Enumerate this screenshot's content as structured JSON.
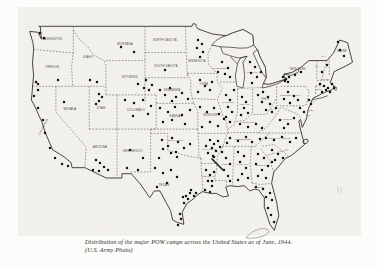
{
  "figure": {
    "caption_line1": "Distribution of the major POW camps across the United States as of June, 1944.",
    "caption_line2": "(U.S. Army Photo)"
  },
  "map": {
    "ink": "#35332c",
    "paper": "#f4f2ec",
    "outline": "M 39.2,26.3 L 192,26.3 L 193,23.6 L 195.8,24.2 L 196.2,26.6 L 198,28.9 L 212.3,34 L 226.3,35.7 L 232.4,33 L 243,29.5 L 252.6,35 L 253.7,45 L 257.5,49.8 L 260,57 L 265.4,67.4 L 266.1,77.7 L 263.2,83.7 L 269,84.5 L 277,82 L 285.5,79.4 L 283.8,74.3 L 292,72.5 L 299.5,68.3 L 309,60.6 L 326.9,60.6 L 333.6,52.9 L 339.7,40 L 347.5,42.6 L 352.5,62.3 L 346.4,65.7 L 334.1,71.7 L 330.2,82.9 L 335.2,87.2 L 331.5,90 L 324.7,92.3 L 312.9,98.3 L 308.5,108.6 L 307.3,113.7 L 306.7,118 L 302.3,127.4 L 300.6,119.5 L 298.8,121 L 300.6,130 L 304.5,144.6 L 291.1,155.7 L 285.5,158.3 L 279.9,165.1 L 273.8,172 L 271.6,183.1 L 276.6,202 L 278.8,215.7 L 274.3,230.3 L 269.9,224.3 L 264.3,207.1 L 264.3,197.7 L 258.7,190 L 254.8,189.1 L 249.8,190.9 L 244.2,185.7 L 237.5,186.6 L 229.7,185.7 L 225.8,187.4 L 228.5,196 L 223,196.9 L 216.3,193.4 L 210.7,193.4 L 202.3,191.7 L 197.3,195.1 L 193.9,198.6 L 186.7,203.7 L 182.2,212.3 L 183.9,224.3 L 177.7,222.6 L 172.7,220 L 170.5,210.6 L 159.9,190.9 L 154.3,190.9 L 149.8,197.7 L 140.3,184 L 131.3,173.7 L 121.9,173.7 L 121.9,178 L 106.2,178 L 85,167.7 L 72.1,167.7 L 71,162.6 L 64.9,157.4 L 52.6,149.7 L 45.3,132.6 L 42,122.3 L 34.7,106 L 31.4,100 L 33.6,75.1 L 32.5,63.1 L 33.6,49.4 L 33.1,43.4 L 29.7,31.4 L 38.1,32.3 L 41.4,39.1 L 40.3,27.1 Z",
    "lakes": [
      "M 211.8,45.1 L 216,40.5 L 222,37 L 226.3,35.7 L 232.4,33 L 243,29.5 L 252.6,35 L 253.7,45 L 247.5,47.8 L 240,48.2 L 230,47.2 L 220.5,46.8 Z",
      "M 247,56.3 L 243,62.3 L 244.7,75.2 L 243,88 L 236.9,86.3 L 235.3,76 L 237.5,64 L 240.3,58 Z",
      "M 257.5,49.8 L 260,57 L 265.4,67.4 L 266.1,77.7 L 262.5,73.5 L 258.5,65 L 255.2,57.5 L 253.1,52.9 Z",
      "M 262.3,88 L 270,86.3 L 278,83.6 L 285.5,79.4 L 277,82 L 269,84.5 L 263.2,83.7 Z",
      "M 283.8,74.3 L 291,75.3 L 298,72.5 L 299.5,68.3 L 292,72.5 Z"
    ],
    "shorelines": [
      "220.5,46.8 223,53.5 229.5,55.5 237,57.8 240.3,58",
      "240.3,58 244,57 247,56.3",
      "237.5,64 234,60.5 230.5,56.5",
      "313.5,99.5 321,98 327.5,95.8",
      "333.5,86.5 336.5,87.5 335.8,90.5"
    ],
    "borders": [
      "33.6,49.4 61.5,52 73.3,52.9",
      "73.3,26.3 73.3,52.9 71.6,66.6 72.7,86.3",
      "32.5,86.3 105.9,86.3",
      "73.3,30 80,40 87.8,46.9 93.9,55.4 104,60.6 105.9,64.9 105.9,94.9",
      "105.9,60.6 145,60.6",
      "145,26.3 145,103.4",
      "145,52.5 186.2,52.5",
      "185.5,26.3 186.2,52.5 187.5,77.7",
      "187.5,73.4 216.8,73.4",
      "187.5,73.4 191.1,82 190.6,90.6 193.9,103.4",
      "145,77.7 187.5,77.7",
      "156.2,103.4 193.9,103.4",
      "150.6,129.1 197.8,129.1",
      "156.2,94.9 156.2,129.1",
      "105.9,94.9 156.2,94.9",
      "89.2,86.3 89.2,129.1",
      "117.1,94.9 117.1,129.1",
      "89.2,129.1 156.2,129.1",
      "55.9,86.3 55.9,112 86.1,147.1 85,167.7",
      "117.1,129.1 117.1,178",
      "150.6,129.1 150.6,172",
      "130.8,172 150.6,172",
      "150.6,133.4 167.7,133.4 167.7,150.6 172.1,151.4 183.3,154.9 190,156.6 200.9,158.3",
      "193.9,103.4 197.8,111.1 197.8,129.1",
      "197.8,129.1 198.7,142 198.7,156.6 200.9,158.3",
      "200.9,158.3 201.5,172 202.9,189.1 202.3,191.7",
      "197.8,133.4 227.4,133.4",
      "200.9,163.4 216.8,163.4",
      "211.8,45.1 207.9,53.7",
      "207.9,53.7 208.4,64 216.8,73.4 217.4,82 222.4,88 217.4,99.1 221.9,112.9 226.3,123.1 228,132.6 225.2,138.6 223,146.3 217.4,156.6 216.8,166.9 214.6,180.6 227,180.6 226,187.4",
      "191.3,98.3 215.7,99.5",
      "220.1,82 236.9,82",
      "237.5,88.9 237.5,112 235.3,121.4",
      "276,99.1 267.1,113.7 259.8,114.6 251.4,114.6 244.2,120.6 235.3,121.4 234.2,124.9 228,129.1",
      "252.6,88.9 252.6,114.6",
      "237.5,88.5 262,87.5",
      "276.6,86.3 276.6,105.8",
      "276.6,105.8 302.9,105.8",
      "258.7,132.6 267,127 276,115 281,107",
      "258.7,133 302.3,133",
      "227.4,132.6 258.7,132.6",
      "221.9,146.3 255.4,146.3",
      "255.4,146.3 269.9,132.6",
      "262.1,146.3 274.3,144.6 287.7,155.7",
      "261,148.9 268.8,159.1 273.8,172",
      "234.2,146.3 232.4,185.7",
      "251.4,146.3 250.3,164 252,183.1",
      "252,183.1 260,184.5 271.6,183.5",
      "280.7,86.3 305.6,86.3",
      "305.6,86.3 309,91.4 306.8,104.3 302.9,105.8",
      "316.8,60.6 316.8,80.3",
      "321.3,80.3 326.9,60.6",
      "316.8,80.3 330,80.3",
      "315.7,85.9 324.7,85.9",
      "315.7,85.9 315.7,94",
      "329.5,75 329,58",
      "282,107.5 290,111 296,113.5 301,117.5"
    ],
    "state_labels": [
      {
        "t": "WASHINGTON",
        "x": 52,
        "y": 40,
        "s": 2.6
      },
      {
        "t": "OREGON",
        "x": 52,
        "y": 68,
        "s": 2.8
      },
      {
        "t": "IDAHO",
        "x": 88,
        "y": 58,
        "s": 2.8
      },
      {
        "t": "MONTANA",
        "x": 125,
        "y": 45,
        "s": 2.8
      },
      {
        "t": "NORTH DAKOTA",
        "x": 165,
        "y": 41,
        "s": 2.6
      },
      {
        "t": "SOUTH DAKOTA",
        "x": 166,
        "y": 67,
        "s": 2.6
      },
      {
        "t": "MINNESOTA",
        "x": 197,
        "y": 62,
        "s": 2.6
      },
      {
        "t": "WISCONSIN",
        "x": 221,
        "y": 69,
        "s": 2.5
      },
      {
        "t": "MICHIGAN",
        "x": 254,
        "y": 73,
        "s": 2.4
      },
      {
        "t": "NEW YORK",
        "x": 298,
        "y": 70,
        "s": 2.6
      },
      {
        "t": "MAINE",
        "x": 342,
        "y": 52,
        "s": 2.6
      },
      {
        "t": "PENNSYLVANIA",
        "x": 291,
        "y": 96,
        "s": 2.4
      },
      {
        "t": "OHIO",
        "x": 265,
        "y": 100,
        "s": 2.8
      },
      {
        "t": "INDIANA",
        "x": 245,
        "y": 105,
        "s": 2.3
      },
      {
        "t": "ILLINOIS",
        "x": 228,
        "y": 103,
        "s": 2.3
      },
      {
        "t": "IOWA",
        "x": 204,
        "y": 85,
        "s": 2.8
      },
      {
        "t": "NEBRASKA",
        "x": 172,
        "y": 91,
        "s": 2.6
      },
      {
        "t": "WYOMING",
        "x": 130,
        "y": 78,
        "s": 2.8
      },
      {
        "t": "UTAH",
        "x": 101,
        "y": 109,
        "s": 2.8
      },
      {
        "t": "NEVADA",
        "x": 70,
        "y": 110,
        "s": 2.8
      },
      {
        "t": "CALIFORNIA",
        "x": 44,
        "y": 127,
        "s": 2.6,
        "r": -62
      },
      {
        "t": "COLORADO",
        "x": 136,
        "y": 111,
        "s": 2.8
      },
      {
        "t": "KANSAS",
        "x": 176,
        "y": 117,
        "s": 2.8
      },
      {
        "t": "MISSOURI",
        "x": 211,
        "y": 116,
        "s": 2.6
      },
      {
        "t": "KENTUCKY",
        "x": 249,
        "y": 123,
        "s": 2.4
      },
      {
        "t": "W.VA",
        "x": 273,
        "y": 110,
        "s": 2.2
      },
      {
        "t": "VIRGINIA",
        "x": 288,
        "y": 120,
        "s": 2.4
      },
      {
        "t": "ARIZONA",
        "x": 100,
        "y": 148,
        "s": 2.8
      },
      {
        "t": "NEW MEXICO",
        "x": 133,
        "y": 152,
        "s": 2.6
      },
      {
        "t": "OKLAHOMA",
        "x": 176,
        "y": 141,
        "s": 2.5
      },
      {
        "t": "ARKANSAS",
        "x": 209,
        "y": 150,
        "s": 2.3
      },
      {
        "t": "TENNESSEE",
        "x": 243,
        "y": 140,
        "s": 2.4
      },
      {
        "t": "NORTH CAROLINA",
        "x": 280,
        "y": 139,
        "s": 2.2
      },
      {
        "t": "SOUTH CAROLINA",
        "x": 278,
        "y": 153,
        "s": 2.1,
        "r": -15
      },
      {
        "t": "GEORGIA",
        "x": 262,
        "y": 166,
        "s": 2.5
      },
      {
        "t": "ALABAMA",
        "x": 242,
        "y": 165,
        "s": 2.4
      },
      {
        "t": "MISS.",
        "x": 225,
        "y": 165,
        "s": 2.4
      },
      {
        "t": "LOUISIANA",
        "x": 209,
        "y": 177,
        "s": 2.3
      },
      {
        "t": "TEXAS",
        "x": 164,
        "y": 186,
        "s": 2.9
      },
      {
        "t": "FLORIDA",
        "x": 260,
        "y": 188,
        "s": 2.2
      },
      {
        "t": "VT.",
        "x": 317,
        "y": 67,
        "s": 2
      },
      {
        "t": "N.H.",
        "x": 324,
        "y": 57,
        "s": 2
      },
      {
        "t": "MASS.",
        "x": 326,
        "y": 79.5,
        "s": 2
      },
      {
        "t": "CONN.",
        "x": 319,
        "y": 89.5,
        "s": 2
      },
      {
        "t": "R.I.",
        "x": 336,
        "y": 90,
        "s": 2
      },
      {
        "t": "N.J.",
        "x": 313,
        "y": 102,
        "s": 2
      },
      {
        "t": "DEL.",
        "x": 312,
        "y": 110.5,
        "s": 2
      },
      {
        "t": "MD.",
        "x": 309,
        "y": 115.5,
        "s": 2
      }
    ],
    "camps": [
      [
        40,
        33
      ],
      [
        44,
        38
      ],
      [
        58,
        80
      ],
      [
        38,
        84
      ],
      [
        90,
        80
      ],
      [
        97,
        82
      ],
      [
        121,
        47
      ],
      [
        134,
        52
      ],
      [
        138,
        84
      ],
      [
        144,
        88
      ],
      [
        149,
        90
      ],
      [
        152,
        85
      ],
      [
        146,
        80
      ],
      [
        64,
        102
      ],
      [
        99,
        94
      ],
      [
        102,
        97
      ],
      [
        99,
        101
      ],
      [
        96,
        104
      ],
      [
        36,
        82
      ],
      [
        34,
        96
      ],
      [
        38,
        90
      ],
      [
        38,
        108
      ],
      [
        43,
        120
      ],
      [
        45,
        133
      ],
      [
        50,
        148
      ],
      [
        55,
        158
      ],
      [
        62,
        164
      ],
      [
        68,
        166
      ],
      [
        96,
        160
      ],
      [
        100,
        163
      ],
      [
        104,
        167
      ],
      [
        108,
        170
      ],
      [
        99,
        171
      ],
      [
        93,
        170
      ],
      [
        130,
        150
      ],
      [
        127,
        168
      ],
      [
        138,
        170
      ],
      [
        143,
        158
      ],
      [
        125,
        100
      ],
      [
        134,
        103
      ],
      [
        143,
        100
      ],
      [
        151,
        106
      ],
      [
        148,
        114
      ],
      [
        133,
        116
      ],
      [
        165,
        70
      ],
      [
        198,
        40
      ],
      [
        202,
        44
      ],
      [
        197,
        48
      ],
      [
        203,
        52
      ],
      [
        200,
        57
      ],
      [
        222,
        62
      ],
      [
        228,
        68
      ],
      [
        225,
        74
      ],
      [
        230,
        77
      ],
      [
        218,
        72
      ],
      [
        250,
        62
      ],
      [
        255,
        67
      ],
      [
        251,
        73
      ],
      [
        257,
        77
      ],
      [
        252,
        83
      ],
      [
        261,
        72
      ],
      [
        160,
        90
      ],
      [
        165,
        95
      ],
      [
        170,
        88
      ],
      [
        176,
        97
      ],
      [
        182,
        93
      ],
      [
        188,
        99
      ],
      [
        172,
        101
      ],
      [
        200,
        80
      ],
      [
        205,
        86
      ],
      [
        210,
        90
      ],
      [
        198,
        92
      ],
      [
        212,
        82
      ],
      [
        160,
        108
      ],
      [
        168,
        112
      ],
      [
        175,
        107
      ],
      [
        182,
        115
      ],
      [
        190,
        110
      ],
      [
        172,
        120
      ],
      [
        185,
        124
      ],
      [
        163,
        122
      ],
      [
        200,
        107
      ],
      [
        207,
        112
      ],
      [
        214,
        108
      ],
      [
        219,
        114
      ],
      [
        210,
        122
      ],
      [
        202,
        127
      ],
      [
        218,
        126
      ],
      [
        224,
        119
      ],
      [
        226,
        95
      ],
      [
        230,
        100
      ],
      [
        228,
        107
      ],
      [
        232,
        112
      ],
      [
        226,
        117
      ],
      [
        230,
        122
      ],
      [
        234,
        90
      ],
      [
        242,
        97
      ],
      [
        246,
        102
      ],
      [
        244,
        108
      ],
      [
        248,
        113
      ],
      [
        241,
        115
      ],
      [
        258,
        95
      ],
      [
        263,
        92
      ],
      [
        268,
        97
      ],
      [
        262,
        102
      ],
      [
        270,
        104
      ],
      [
        266,
        110
      ],
      [
        240,
        124
      ],
      [
        248,
        127
      ],
      [
        256,
        124
      ],
      [
        262,
        128
      ],
      [
        230,
        138
      ],
      [
        238,
        141
      ],
      [
        246,
        137
      ],
      [
        252,
        142
      ],
      [
        260,
        139
      ],
      [
        227,
        143
      ],
      [
        172,
        138
      ],
      [
        178,
        142
      ],
      [
        168,
        146
      ],
      [
        184,
        148
      ],
      [
        190,
        144
      ],
      [
        176,
        152
      ],
      [
        162,
        140
      ],
      [
        210,
        140
      ],
      [
        214,
        144
      ],
      [
        218,
        141
      ],
      [
        212,
        148
      ],
      [
        216,
        151
      ],
      [
        220,
        147
      ],
      [
        208,
        153
      ],
      [
        213,
        156
      ],
      [
        214,
        157
      ],
      [
        206,
        146
      ],
      [
        206,
        170
      ],
      [
        210,
        175
      ],
      [
        214,
        172
      ],
      [
        208,
        181
      ],
      [
        212,
        186
      ],
      [
        212,
        181
      ],
      [
        205,
        190
      ],
      [
        210,
        192
      ],
      [
        222,
        152
      ],
      [
        226,
        158
      ],
      [
        230,
        164
      ],
      [
        224,
        170
      ],
      [
        228,
        176
      ],
      [
        230,
        181
      ],
      [
        238,
        152
      ],
      [
        244,
        156
      ],
      [
        240,
        162
      ],
      [
        246,
        168
      ],
      [
        242,
        174
      ],
      [
        238,
        180
      ],
      [
        248,
        178
      ],
      [
        258,
        154
      ],
      [
        264,
        158
      ],
      [
        256,
        164
      ],
      [
        262,
        170
      ],
      [
        268,
        166
      ],
      [
        258,
        176
      ],
      [
        266,
        178
      ],
      [
        272,
        162
      ],
      [
        272,
        150
      ],
      [
        278,
        154
      ],
      [
        283,
        158
      ],
      [
        275,
        160
      ],
      [
        266,
        138
      ],
      [
        274,
        140
      ],
      [
        282,
        137
      ],
      [
        290,
        142
      ],
      [
        296,
        138
      ],
      [
        280,
        120
      ],
      [
        288,
        124
      ],
      [
        294,
        118
      ],
      [
        284,
        128
      ],
      [
        272,
        112
      ],
      [
        276,
        108
      ],
      [
        256,
        187
      ],
      [
        263,
        189
      ],
      [
        270,
        193
      ],
      [
        272,
        200
      ],
      [
        268,
        208
      ],
      [
        271,
        215
      ],
      [
        274,
        222
      ],
      [
        266,
        197
      ],
      [
        163,
        149
      ],
      [
        171,
        153
      ],
      [
        159,
        158
      ],
      [
        177,
        157
      ],
      [
        155,
        168
      ],
      [
        163,
        173
      ],
      [
        171,
        170
      ],
      [
        177,
        177
      ],
      [
        167,
        183
      ],
      [
        157,
        187
      ],
      [
        186,
        196
      ],
      [
        190,
        193
      ],
      [
        194,
        196
      ],
      [
        188,
        199
      ],
      [
        184,
        203
      ],
      [
        183,
        197
      ],
      [
        196,
        193
      ],
      [
        191,
        190
      ],
      [
        180,
        214
      ],
      [
        181,
        219
      ],
      [
        178,
        225
      ],
      [
        283,
        77
      ],
      [
        286,
        79
      ],
      [
        289,
        77
      ],
      [
        285,
        81
      ],
      [
        288,
        82
      ],
      [
        295,
        75
      ],
      [
        301,
        72
      ],
      [
        288,
        92
      ],
      [
        294,
        96
      ],
      [
        284,
        99
      ],
      [
        298,
        100
      ],
      [
        290,
        103
      ],
      [
        309,
        100
      ],
      [
        311,
        104
      ],
      [
        300,
        108
      ],
      [
        304,
        112
      ],
      [
        320,
        84
      ],
      [
        324,
        86
      ],
      [
        328,
        88
      ],
      [
        332,
        84
      ],
      [
        326,
        90
      ],
      [
        330,
        92
      ],
      [
        322,
        92
      ],
      [
        334,
        88
      ],
      [
        322,
        72
      ],
      [
        327,
        65
      ],
      [
        340,
        50
      ],
      [
        344,
        56
      ],
      [
        338,
        42
      ]
    ],
    "marks": {
      "ridge": "M 212,159 L 223,170",
      "pen_loop": "M 246,238 C 252,229.5 265,226 268.5,230.5 C 270.5,234 259,239.5 246,238",
      "smudge": "M 337.5,186 q 1.2,3.2 0.2,6.4 M 340.8,187.2 q 1.2,3.2 0.2,6.4"
    }
  }
}
